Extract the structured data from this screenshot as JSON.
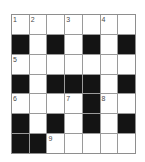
{
  "puzzle": {
    "type": "crossword-grid",
    "rows": 7,
    "columns": 7,
    "colors": {
      "white_cell": "#ffffff",
      "block_cell": "#141414",
      "grid_line": "#9a9a9a",
      "number_text": "#4a4a4a",
      "background": "#ffffff"
    },
    "grid": [
      [
        {
          "block": false,
          "number": "1"
        },
        {
          "block": false,
          "number": "2"
        },
        {
          "block": false,
          "number": ""
        },
        {
          "block": false,
          "number": "3"
        },
        {
          "block": false,
          "number": ""
        },
        {
          "block": false,
          "number": "4"
        },
        {
          "block": false,
          "number": ""
        }
      ],
      [
        {
          "block": true,
          "number": ""
        },
        {
          "block": false,
          "number": ""
        },
        {
          "block": true,
          "number": ""
        },
        {
          "block": false,
          "number": ""
        },
        {
          "block": true,
          "number": ""
        },
        {
          "block": false,
          "number": ""
        },
        {
          "block": true,
          "number": ""
        }
      ],
      [
        {
          "block": false,
          "number": "5"
        },
        {
          "block": false,
          "number": ""
        },
        {
          "block": false,
          "number": ""
        },
        {
          "block": false,
          "number": ""
        },
        {
          "block": false,
          "number": ""
        },
        {
          "block": false,
          "number": ""
        },
        {
          "block": false,
          "number": ""
        }
      ],
      [
        {
          "block": true,
          "number": ""
        },
        {
          "block": false,
          "number": ""
        },
        {
          "block": true,
          "number": ""
        },
        {
          "block": true,
          "number": ""
        },
        {
          "block": true,
          "number": ""
        },
        {
          "block": false,
          "number": ""
        },
        {
          "block": true,
          "number": ""
        }
      ],
      [
        {
          "block": false,
          "number": "6"
        },
        {
          "block": false,
          "number": ""
        },
        {
          "block": false,
          "number": ""
        },
        {
          "block": false,
          "number": "7"
        },
        {
          "block": true,
          "number": ""
        },
        {
          "block": false,
          "number": "8"
        },
        {
          "block": false,
          "number": ""
        }
      ],
      [
        {
          "block": true,
          "number": ""
        },
        {
          "block": false,
          "number": ""
        },
        {
          "block": true,
          "number": ""
        },
        {
          "block": false,
          "number": ""
        },
        {
          "block": true,
          "number": ""
        },
        {
          "block": false,
          "number": ""
        },
        {
          "block": true,
          "number": ""
        }
      ],
      [
        {
          "block": true,
          "number": ""
        },
        {
          "block": true,
          "number": ""
        },
        {
          "block": false,
          "number": "9"
        },
        {
          "block": false,
          "number": ""
        },
        {
          "block": false,
          "number": ""
        },
        {
          "block": false,
          "number": ""
        },
        {
          "block": false,
          "number": ""
        }
      ]
    ],
    "clue_numbers": [
      "1",
      "2",
      "3",
      "4",
      "5",
      "6",
      "7",
      "8",
      "9"
    ]
  }
}
